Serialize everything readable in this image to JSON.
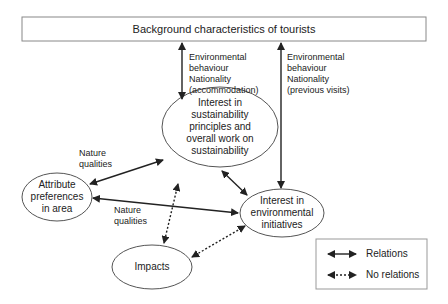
{
  "diagram": {
    "top_box": {
      "label": "Background characteristics of tourists"
    },
    "nodes": [
      {
        "id": "sustainability",
        "lines": [
          "Interest in",
          "sustainability",
          "principles and",
          "overall work on",
          "sustainability"
        ]
      },
      {
        "id": "attribute",
        "lines": [
          "Attribute",
          "preferences",
          "in area"
        ]
      },
      {
        "id": "environmental",
        "lines": [
          "Interest in",
          "environmental",
          "initiatives"
        ]
      },
      {
        "id": "impacts",
        "lines": [
          "Impacts"
        ]
      }
    ],
    "edge_labels": {
      "background_to_sustainability": [
        "Environmental",
        "behaviour",
        "Nationality",
        "(accommodation)"
      ],
      "background_to_environmental": [
        "Environmental",
        "behaviour",
        "Nationality",
        "(previous visits)"
      ],
      "attribute_to_sustainability": [
        "Nature",
        "qualities"
      ],
      "attribute_to_environmental": [
        "Nature",
        "qualities"
      ]
    },
    "edges": [
      {
        "from": "background",
        "to": "sustainability",
        "type": "relations"
      },
      {
        "from": "background",
        "to": "environmental",
        "type": "relations"
      },
      {
        "from": "attribute",
        "to": "sustainability",
        "type": "relations"
      },
      {
        "from": "attribute",
        "to": "environmental",
        "type": "relations"
      },
      {
        "from": "sustainability",
        "to": "environmental",
        "type": "relations"
      },
      {
        "from": "sustainability",
        "to": "impacts",
        "type": "no relations"
      },
      {
        "from": "environmental",
        "to": "impacts",
        "type": "no relations"
      }
    ],
    "legend": {
      "relations": "Relations",
      "no_relations": "No relations"
    }
  }
}
